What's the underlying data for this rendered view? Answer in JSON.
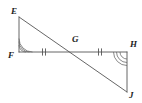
{
  "figure": {
    "kind": "geometry-diagram",
    "background_color": "#ffffff",
    "stroke_color": "#555555",
    "label_color": "#1c1c1c",
    "width": 142,
    "height": 103,
    "points": [
      {
        "name": "E",
        "label": "E",
        "x": 19,
        "y": 17,
        "label_x": 11,
        "label_y": 7
      },
      {
        "name": "F",
        "label": "F",
        "x": 19,
        "y": 52,
        "label_x": 8,
        "label_y": 51
      },
      {
        "name": "G",
        "label": "G",
        "x": 73,
        "y": 52,
        "label_x": 72,
        "label_y": 35
      },
      {
        "name": "H",
        "label": "H",
        "x": 127,
        "y": 52,
        "label_x": 130,
        "label_y": 40
      },
      {
        "name": "J",
        "label": "J",
        "x": 127,
        "y": 92,
        "label_x": 129,
        "label_y": 91
      }
    ],
    "segments": [
      {
        "name": "EF",
        "from": "E",
        "to": "F",
        "x1": 19,
        "y1": 17,
        "x2": 19,
        "y2": 52
      },
      {
        "name": "FH",
        "from": "F",
        "to": "H",
        "x1": 19,
        "y1": 52,
        "x2": 127,
        "y2": 52
      },
      {
        "name": "HJ",
        "from": "H",
        "to": "J",
        "x1": 127,
        "y1": 52,
        "x2": 127,
        "y2": 92
      },
      {
        "name": "EJ",
        "from": "E",
        "to": "J",
        "x1": 19,
        "y1": 17,
        "x2": 127,
        "y2": 92
      }
    ],
    "tick_marks": [
      {
        "name": "FG",
        "segment": "FG",
        "count": 2,
        "cx": 44,
        "cy": 52
      },
      {
        "name": "GH",
        "segment": "GH",
        "count": 2,
        "cx": 100,
        "cy": 52
      }
    ],
    "angle_arcs": [
      {
        "name": "angle-F",
        "vertex": "F",
        "count": 2,
        "x": 19,
        "y": 52,
        "start_deg": 270,
        "end_deg": 0
      },
      {
        "name": "angle-H",
        "vertex": "H",
        "count": 2,
        "x": 127,
        "y": 52,
        "start_deg": 90,
        "end_deg": 180
      }
    ]
  }
}
